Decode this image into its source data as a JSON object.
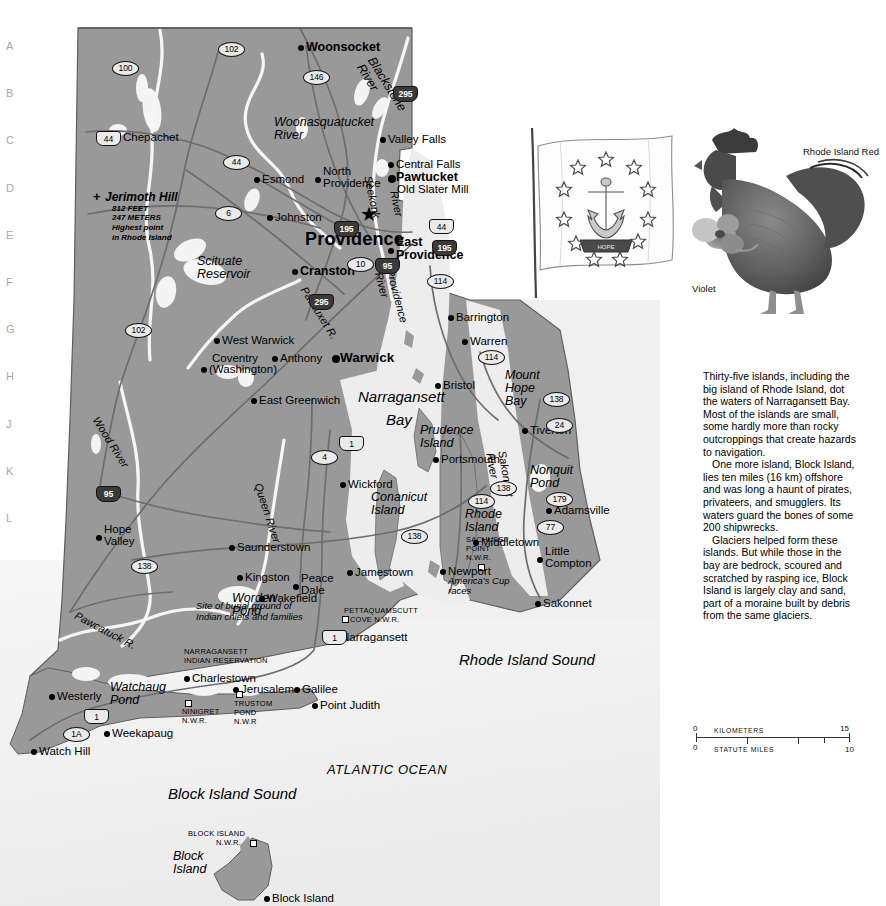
{
  "page": {
    "width": 886,
    "height": 906,
    "title": "Rhode Island",
    "land_color": "#999999",
    "water_color": "#ececec",
    "ocean_color": "#f2f2f2",
    "border_color": "#5a5a5a",
    "road_color": "#6b6b6b"
  },
  "index_rows": [
    "A",
    "B",
    "C",
    "D",
    "E",
    "F",
    "G",
    "H",
    "J",
    "K",
    "L",
    "M",
    "N",
    "O",
    "P",
    "Q",
    "R",
    "S",
    "T"
  ],
  "cities": [
    {
      "name": "Woonsocket",
      "x": 306,
      "y": 41,
      "anchor": "left",
      "size": "city2",
      "dot": "md"
    },
    {
      "name": "Chepachet",
      "x": 123,
      "y": 131,
      "anchor": "left",
      "size": "city",
      "dot": "md"
    },
    {
      "name": "Valley Falls",
      "x": 388,
      "y": 133,
      "anchor": "left",
      "size": "city",
      "dot": "md"
    },
    {
      "name": "Central Falls",
      "x": 396,
      "y": 158,
      "anchor": "left",
      "size": "city",
      "dot": "md"
    },
    {
      "name": "Pawtucket",
      "x": 396,
      "y": 171,
      "anchor": "left",
      "size": "city2",
      "dot": "lg"
    },
    {
      "name": "Old Slater Mill",
      "x": 397,
      "y": 183,
      "anchor": "left",
      "size": "city",
      "dot": "none"
    },
    {
      "name": "Esmond",
      "x": 262,
      "y": 173,
      "anchor": "left",
      "size": "city",
      "dot": "md"
    },
    {
      "name": "North\nProvidence",
      "x": 323,
      "y": 165,
      "anchor": "left",
      "size": "city",
      "dot": "md"
    },
    {
      "name": "Johnston",
      "x": 275,
      "y": 211,
      "anchor": "left",
      "size": "city",
      "dot": "md"
    },
    {
      "name": "Providence",
      "x": 305,
      "y": 230,
      "anchor": "left",
      "size": "capital",
      "dot": "star"
    },
    {
      "name": "East\nProvidence",
      "x": 396,
      "y": 236,
      "anchor": "left",
      "size": "city2",
      "dot": "md"
    },
    {
      "name": "Cranston",
      "x": 300,
      "y": 265,
      "anchor": "left",
      "size": "city2",
      "dot": "md"
    },
    {
      "name": "Barrington",
      "x": 456,
      "y": 311,
      "anchor": "left",
      "size": "city",
      "dot": "md"
    },
    {
      "name": "Warren",
      "x": 470,
      "y": 335,
      "anchor": "left",
      "size": "city",
      "dot": "md"
    },
    {
      "name": "West Warwick",
      "x": 222,
      "y": 334,
      "anchor": "left",
      "size": "city",
      "dot": "md"
    },
    {
      "name": "Coventry",
      "x": 212,
      "y": 352,
      "anchor": "left",
      "size": "city",
      "dot": "none"
    },
    {
      "name": "(Washington)",
      "x": 209,
      "y": 363,
      "anchor": "left",
      "size": "city",
      "dot": "md"
    },
    {
      "name": "Anthony",
      "x": 280,
      "y": 352,
      "anchor": "left",
      "size": "city",
      "dot": "md"
    },
    {
      "name": "Warwick",
      "x": 340,
      "y": 351,
      "anchor": "left",
      "size": "big",
      "dot": "lg"
    },
    {
      "name": "Bristol",
      "x": 443,
      "y": 379,
      "anchor": "left",
      "size": "city",
      "dot": "md"
    },
    {
      "name": "East Greenwich",
      "x": 259,
      "y": 394,
      "anchor": "left",
      "size": "city",
      "dot": "md"
    },
    {
      "name": "Tiverton",
      "x": 530,
      "y": 424,
      "anchor": "left",
      "size": "city",
      "dot": "md"
    },
    {
      "name": "Portsmouth",
      "x": 441,
      "y": 453,
      "anchor": "left",
      "size": "city",
      "dot": "md"
    },
    {
      "name": "Wickford",
      "x": 348,
      "y": 478,
      "anchor": "left",
      "size": "city",
      "dot": "md"
    },
    {
      "name": "Adamsville",
      "x": 554,
      "y": 504,
      "anchor": "left",
      "size": "city",
      "dot": "md"
    },
    {
      "name": "Hope\nValley",
      "x": 104,
      "y": 523,
      "anchor": "left",
      "size": "city",
      "dot": "md"
    },
    {
      "name": "Middletown",
      "x": 481,
      "y": 536,
      "anchor": "left",
      "size": "city",
      "dot": "md"
    },
    {
      "name": "Saunderstown",
      "x": 237,
      "y": 541,
      "anchor": "left",
      "size": "city",
      "dot": "md"
    },
    {
      "name": "Little\nCompton",
      "x": 545,
      "y": 545,
      "anchor": "left",
      "size": "city",
      "dot": "md"
    },
    {
      "name": "Jamestown",
      "x": 355,
      "y": 566,
      "anchor": "left",
      "size": "city",
      "dot": "md"
    },
    {
      "name": "Kingston",
      "x": 245,
      "y": 571,
      "anchor": "left",
      "size": "city",
      "dot": "md"
    },
    {
      "name": "Newport",
      "x": 448,
      "y": 565,
      "anchor": "left",
      "size": "city",
      "dot": "md"
    },
    {
      "name": "Peace\nDale",
      "x": 301,
      "y": 572,
      "anchor": "left",
      "size": "city",
      "dot": "md"
    },
    {
      "name": "Sakonnet",
      "x": 543,
      "y": 597,
      "anchor": "left",
      "size": "city",
      "dot": "md"
    },
    {
      "name": "Wakefield",
      "x": 267,
      "y": 592,
      "anchor": "left",
      "size": "city",
      "dot": "md"
    },
    {
      "name": "Narragansett",
      "x": 341,
      "y": 631,
      "anchor": "left",
      "size": "city",
      "dot": "md"
    },
    {
      "name": "Charlestown",
      "x": 192,
      "y": 672,
      "anchor": "left",
      "size": "city",
      "dot": "md"
    },
    {
      "name": "Jerusalem",
      "x": 241,
      "y": 683,
      "anchor": "left",
      "size": "city",
      "dot": "md"
    },
    {
      "name": "Galilee",
      "x": 302,
      "y": 683,
      "anchor": "left",
      "size": "city",
      "dot": "md"
    },
    {
      "name": "Point Judith",
      "x": 320,
      "y": 699,
      "anchor": "left",
      "size": "city",
      "dot": "md"
    },
    {
      "name": "Westerly",
      "x": 57,
      "y": 690,
      "anchor": "left",
      "size": "city",
      "dot": "md"
    },
    {
      "name": "Weekapaug",
      "x": 112,
      "y": 727,
      "anchor": "left",
      "size": "city",
      "dot": "md"
    },
    {
      "name": "Watch Hill",
      "x": 39,
      "y": 745,
      "anchor": "left",
      "size": "city",
      "dot": "md"
    },
    {
      "name": "Block Island",
      "x": 272,
      "y": 892,
      "anchor": "left",
      "size": "city",
      "dot": "md"
    }
  ],
  "water_labels": [
    {
      "text": "Blackstone\nRiver",
      "x": 376,
      "y": 55,
      "rot": 58,
      "style": "water"
    },
    {
      "text": "Woonasquatucket\nRiver",
      "x": 274,
      "y": 116,
      "rot": 0,
      "style": "water"
    },
    {
      "text": "Seekonk",
      "x": 373,
      "y": 175,
      "rot": 78,
      "style": "riverlbl"
    },
    {
      "text": "River",
      "x": 399,
      "y": 190,
      "rot": 78,
      "style": "riverlbl"
    },
    {
      "text": "Scituate\nReservoir",
      "x": 197,
      "y": 255,
      "rot": 0,
      "style": "water"
    },
    {
      "text": "Pawtuxet R.",
      "x": 308,
      "y": 285,
      "rot": 58,
      "style": "riverlbl"
    },
    {
      "text": "Providence\nRiver",
      "x": 395,
      "y": 268,
      "rot": 75,
      "style": "riverlbl"
    },
    {
      "text": "Narragansett",
      "x": 358,
      "y": 389,
      "rot": 0,
      "style": "waterbig"
    },
    {
      "text": "Bay",
      "x": 386,
      "y": 412,
      "rot": 0,
      "style": "waterbig"
    },
    {
      "text": "Mount\nHope\nBay",
      "x": 505,
      "y": 369,
      "rot": 0,
      "style": "water"
    },
    {
      "text": "Prudence\nIsland",
      "x": 420,
      "y": 424,
      "rot": 0,
      "style": "water"
    },
    {
      "text": "Sakonnet\nRiver",
      "x": 507,
      "y": 450,
      "rot": 80,
      "style": "riverlbl"
    },
    {
      "text": "Nonquit\nPond",
      "x": 530,
      "y": 464,
      "rot": 0,
      "style": "water"
    },
    {
      "text": "Conanicut\nIsland",
      "x": 371,
      "y": 491,
      "rot": 0,
      "style": "water"
    },
    {
      "text": "Rhode\nIsland",
      "x": 465,
      "y": 508,
      "rot": 0,
      "style": "water"
    },
    {
      "text": "Wood River",
      "x": 100,
      "y": 415,
      "rot": 58,
      "style": "riverlbl"
    },
    {
      "text": "Queen River",
      "x": 263,
      "y": 482,
      "rot": 72,
      "style": "riverlbl"
    },
    {
      "text": "Worden\nPond",
      "x": 232,
      "y": 592,
      "rot": 0,
      "style": "water"
    },
    {
      "text": "Pawcatuck R.",
      "x": 78,
      "y": 610,
      "rot": 28,
      "style": "riverlbl"
    },
    {
      "text": "Watchaug\nPond",
      "x": 110,
      "y": 681,
      "rot": 0,
      "style": "water"
    },
    {
      "text": "Rhode Island Sound",
      "x": 459,
      "y": 652,
      "rot": 0,
      "style": "waterbig"
    },
    {
      "text": "ATLANTIC OCEAN",
      "x": 327,
      "y": 763,
      "rot": 0,
      "style": "ocean"
    },
    {
      "text": "Block Island Sound",
      "x": 168,
      "y": 786,
      "rot": 0,
      "style": "waterbig"
    },
    {
      "text": "Block\nIsland",
      "x": 173,
      "y": 850,
      "rot": 0,
      "style": "water"
    }
  ],
  "annotations": [
    {
      "text": "Jerimoth Hill",
      "x": 105,
      "y": 191,
      "style": "hill"
    },
    {
      "text": "812 FEET",
      "x": 112,
      "y": 205,
      "style": "hillsub"
    },
    {
      "text": "247 METERS",
      "x": 112,
      "y": 214,
      "style": "hillsub"
    },
    {
      "text": "Highest point",
      "x": 112,
      "y": 224,
      "style": "hillsub"
    },
    {
      "text": "in Rhode Island",
      "x": 112,
      "y": 234,
      "style": "hillsub"
    },
    {
      "text": "America's Cup",
      "x": 448,
      "y": 576,
      "style": "note"
    },
    {
      "text": "races",
      "x": 448,
      "y": 586,
      "style": "note"
    },
    {
      "text": "SACHUEST",
      "x": 466,
      "y": 536,
      "style": "smallcaps"
    },
    {
      "text": "POINT",
      "x": 466,
      "y": 545,
      "style": "smallcaps"
    },
    {
      "text": "N.W.R.",
      "x": 466,
      "y": 554,
      "style": "smallcaps"
    },
    {
      "text": "PETTAQUAMSCUTT",
      "x": 344,
      "y": 607,
      "style": "smallcaps"
    },
    {
      "text": "COVE N.W.R.",
      "x": 350,
      "y": 616,
      "style": "smallcaps"
    },
    {
      "text": "Site of burial ground of",
      "x": 196,
      "y": 601,
      "style": "note"
    },
    {
      "text": "Indian chiefs and families",
      "x": 196,
      "y": 612,
      "style": "note"
    },
    {
      "text": "NARRAGANSETT",
      "x": 184,
      "y": 648,
      "style": "smallcaps"
    },
    {
      "text": "INDIAN RESERVATION",
      "x": 184,
      "y": 657,
      "style": "smallcaps"
    },
    {
      "text": "NINIGRET",
      "x": 182,
      "y": 708,
      "style": "smallcaps"
    },
    {
      "text": "N.W.R.",
      "x": 182,
      "y": 717,
      "style": "smallcaps"
    },
    {
      "text": "TRUSTOM",
      "x": 234,
      "y": 700,
      "style": "smallcaps"
    },
    {
      "text": "POND",
      "x": 234,
      "y": 709,
      "style": "smallcaps"
    },
    {
      "text": "N.W.R",
      "x": 234,
      "y": 718,
      "style": "smallcaps"
    },
    {
      "text": "BLOCK ISLAND",
      "x": 188,
      "y": 830,
      "style": "smallcaps"
    },
    {
      "text": "N.W.R.",
      "x": 216,
      "y": 839,
      "style": "smallcaps"
    }
  ],
  "nwr_markers": [
    {
      "x": 342,
      "y": 616
    },
    {
      "x": 478,
      "y": 564
    },
    {
      "x": 185,
      "y": 700
    },
    {
      "x": 236,
      "y": 691
    },
    {
      "x": 250,
      "y": 840
    }
  ],
  "shields": [
    {
      "num": "102",
      "x": 218,
      "y": 42,
      "type": "state"
    },
    {
      "num": "100",
      "x": 112,
      "y": 61,
      "type": "state"
    },
    {
      "num": "146",
      "x": 303,
      "y": 70,
      "type": "state"
    },
    {
      "num": "295",
      "x": 393,
      "y": 86,
      "type": "inter"
    },
    {
      "num": "44",
      "x": 96,
      "y": 131,
      "type": "us"
    },
    {
      "num": "44",
      "x": 223,
      "y": 155,
      "type": "state"
    },
    {
      "num": "6",
      "x": 215,
      "y": 206,
      "type": "state"
    },
    {
      "num": "195",
      "x": 334,
      "y": 221,
      "type": "inter"
    },
    {
      "num": "44",
      "x": 429,
      "y": 219,
      "type": "us"
    },
    {
      "num": "195",
      "x": 432,
      "y": 240,
      "type": "inter"
    },
    {
      "num": "10",
      "x": 347,
      "y": 257,
      "type": "state"
    },
    {
      "num": "95",
      "x": 375,
      "y": 258,
      "type": "inter"
    },
    {
      "num": "114",
      "x": 427,
      "y": 274,
      "type": "state"
    },
    {
      "num": "295",
      "x": 309,
      "y": 294,
      "type": "inter"
    },
    {
      "num": "102",
      "x": 125,
      "y": 323,
      "type": "state"
    },
    {
      "num": "114",
      "x": 478,
      "y": 350,
      "type": "state"
    },
    {
      "num": "138",
      "x": 543,
      "y": 392,
      "type": "state"
    },
    {
      "num": "24",
      "x": 546,
      "y": 418,
      "type": "state"
    },
    {
      "num": "1",
      "x": 339,
      "y": 436,
      "type": "us"
    },
    {
      "num": "4",
      "x": 311,
      "y": 450,
      "type": "state"
    },
    {
      "num": "138",
      "x": 490,
      "y": 481,
      "type": "state"
    },
    {
      "num": "95",
      "x": 96,
      "y": 486,
      "type": "inter"
    },
    {
      "num": "114",
      "x": 468,
      "y": 494,
      "type": "state"
    },
    {
      "num": "179",
      "x": 546,
      "y": 492,
      "type": "state"
    },
    {
      "num": "77",
      "x": 537,
      "y": 520,
      "type": "state"
    },
    {
      "num": "138",
      "x": 401,
      "y": 529,
      "type": "state"
    },
    {
      "num": "138",
      "x": 131,
      "y": 559,
      "type": "state"
    },
    {
      "num": "1",
      "x": 322,
      "y": 630,
      "type": "us"
    },
    {
      "num": "1",
      "x": 84,
      "y": 709,
      "type": "us"
    },
    {
      "num": "1A",
      "x": 63,
      "y": 727,
      "type": "state"
    }
  ],
  "illustrations": {
    "flag": {
      "name": "rhode-island-state-flag",
      "caption": ""
    },
    "rooster": {
      "name": "rhode-island-red-rooster",
      "caption": "Rhode\nIsland\nRed"
    },
    "violet": {
      "name": "violet-flower",
      "caption": "Violet"
    }
  },
  "story": {
    "paragraphs": [
      "Thirty-five islands, including the big island of Rhode Island, dot the waters of Narragansett Bay. Most of the islands are small, some hardly more than rocky outcroppings that create hazards to navigation.",
      "One more island, Block Island, lies ten miles (16 km) offshore and was long a haunt of pirates, privateers, and smugglers. Its waters guard the bones of some 200 shipwrecks.",
      "Glaciers helped form these islands. But while those in the bay are bedrock, scoured and scratched by rasping ice, Block Island is largely clay and sand, part of a moraine built by debris from the same glaciers."
    ]
  },
  "scale": {
    "km_label": "KILOMETERS",
    "mi_label": "STATUTE MILES",
    "km_start": "0",
    "km_end": "15",
    "mi_start": "0",
    "mi_end": "10"
  }
}
